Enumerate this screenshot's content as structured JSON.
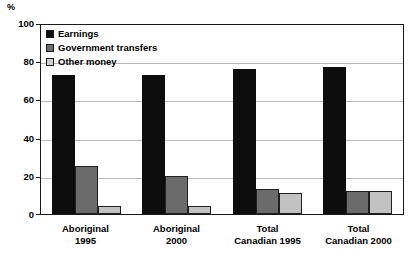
{
  "chart_data": {
    "type": "bar",
    "title": "",
    "subtitle": "",
    "xlabel": "",
    "ylabel": "%",
    "unit_label": "%",
    "ylim": [
      0,
      100
    ],
    "yticks": [
      0,
      20,
      40,
      60,
      80,
      100
    ],
    "grid": true,
    "legend_position": "top-left-inside",
    "categories": [
      {
        "line1": "Aboriginal",
        "line2": "1995"
      },
      {
        "line1": "Aboriginal",
        "line2": "2000"
      },
      {
        "line1": "Total",
        "line2": "Canadian 1995"
      },
      {
        "line1": "Total",
        "line2": "Canadian 2000"
      }
    ],
    "category_labels": [
      "Aboriginal 1995",
      "Aboriginal 2000",
      "Total Canadian 1995",
      "Total Canadian 2000"
    ],
    "series": [
      {
        "name": "Earnings",
        "color": "#0d0d0d",
        "values": [
          73,
          73,
          76,
          77
        ]
      },
      {
        "name": "Government transfers",
        "color": "#6b6b6b",
        "values": [
          25,
          20,
          13,
          12
        ]
      },
      {
        "name": "Other money",
        "color": "#c2c2c2",
        "values": [
          4,
          4,
          11,
          12
        ]
      }
    ]
  },
  "legend": {
    "items": [
      {
        "label": "Earnings",
        "swatch": "earnings"
      },
      {
        "label": "Government transfers",
        "swatch": "gov"
      },
      {
        "label": "Other money",
        "swatch": "other"
      }
    ]
  }
}
